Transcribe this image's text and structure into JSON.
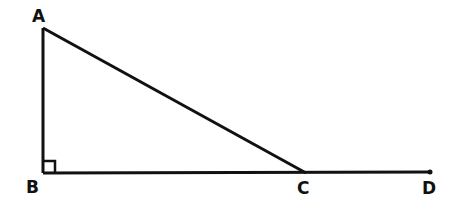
{
  "diagram": {
    "type": "geometry",
    "stroke_color": "#111111",
    "background": "#ffffff",
    "points": {
      "A": {
        "label": "A",
        "x": 43,
        "y": 28
      },
      "B": {
        "label": "B",
        "x": 43,
        "y": 173
      },
      "C": {
        "label": "C",
        "x": 306,
        "y": 173
      },
      "D": {
        "label": "D",
        "x": 430,
        "y": 172
      }
    },
    "segments": [
      {
        "from": "A",
        "to": "B"
      },
      {
        "from": "A",
        "to": "C"
      },
      {
        "from": "B",
        "to": "D"
      }
    ],
    "right_angle_marker": {
      "at": "B",
      "size": 12
    },
    "endpoint_dot": "D"
  },
  "labels": {
    "A": "A",
    "B": "B",
    "C": "C",
    "D": "D"
  }
}
